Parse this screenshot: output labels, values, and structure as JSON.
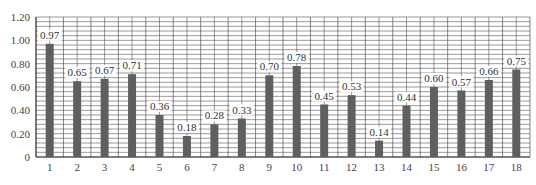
{
  "chart_data": {
    "type": "bar",
    "title": "",
    "xlabel": "",
    "ylabel": "",
    "categories": [
      "1",
      "2",
      "3",
      "4",
      "5",
      "6",
      "7",
      "8",
      "9",
      "10",
      "11",
      "12",
      "13",
      "14",
      "15",
      "16",
      "17",
      "18"
    ],
    "values": [
      0.97,
      0.65,
      0.67,
      0.71,
      0.36,
      0.18,
      0.28,
      0.33,
      0.7,
      0.78,
      0.45,
      0.53,
      0.14,
      0.44,
      0.6,
      0.57,
      0.66,
      0.75
    ],
    "value_labels": [
      "0.97",
      "0.65",
      "0.67",
      "0.71",
      "0.36",
      "0.18",
      "0.28",
      "0.33",
      "0.70",
      "0.78",
      "0.45",
      "0.53",
      "0.14",
      "0.44",
      "0.60",
      "0.57",
      "0.66",
      "0.75"
    ],
    "ylim": [
      0,
      1.2
    ],
    "yticks": [
      0,
      0.2,
      0.4,
      0.6,
      0.8,
      1.0,
      1.2
    ],
    "ytick_labels": [
      "0",
      "0.20",
      "0.40",
      "0.60",
      "0.80",
      "1.00",
      "1.20"
    ],
    "grid": true,
    "minor_grid_step": 0.04,
    "legend": null,
    "colors": {
      "bar": "#5f5f5f",
      "grid": "#555555",
      "background": "#ffffff"
    }
  }
}
